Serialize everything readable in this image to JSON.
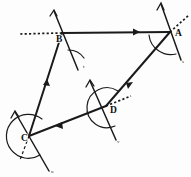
{
  "figure": {
    "kind": "geometry-diagram",
    "canvas": {
      "width": 191,
      "height": 177
    },
    "background_color": "#fdfdfd",
    "ink_color": "#1a1a1a",
    "vertices": [
      {
        "id": "A",
        "label": "A",
        "x": 170,
        "y": 32,
        "label_x": 175,
        "label_y": 36,
        "angle_arc": "minor"
      },
      {
        "id": "B",
        "label": "B",
        "x": 62,
        "y": 33,
        "label_x": 56,
        "label_y": 42,
        "angle_arc": "minor"
      },
      {
        "id": "C",
        "label": "C",
        "x": 29,
        "y": 136,
        "label_x": 22,
        "label_y": 141,
        "angle_arc": "reflex"
      },
      {
        "id": "D",
        "label": "D",
        "x": 106,
        "y": 106,
        "label_x": 110,
        "label_y": 113,
        "angle_arc": "reflex"
      }
    ],
    "edges": [
      {
        "id": "BA",
        "from": "B",
        "to": "A",
        "style": "solid",
        "arrow": "mid-forward"
      },
      {
        "id": "AD",
        "from": "A",
        "to": "D",
        "style": "solid",
        "arrow": "mid-forward"
      },
      {
        "id": "DC",
        "from": "D",
        "to": "C",
        "style": "solid",
        "arrow": "mid-forward"
      },
      {
        "id": "CB",
        "from": "C",
        "to": "B",
        "style": "solid",
        "arrow": "mid-forward"
      }
    ],
    "transversals": [
      {
        "id": "through-A",
        "vertex": "A",
        "note": "line crossing A running upper-left to lower-right"
      },
      {
        "id": "through-B",
        "vertex": "B",
        "note": "line crossing B running upper-right to lower-left"
      },
      {
        "id": "through-C",
        "vertex": "C",
        "note": "line crossing C running upper-left to lower-right"
      },
      {
        "id": "through-D",
        "vertex": "D",
        "note": "line crossing D running upper-left to lower-right"
      }
    ],
    "extension_rays": [
      {
        "id": "ray-A",
        "vertex": "A",
        "style": "dotted",
        "direction": "upper-right"
      },
      {
        "id": "ray-B",
        "vertex": "B",
        "style": "dotted",
        "direction": "left"
      },
      {
        "id": "ray-C",
        "vertex": "C",
        "style": "dashed",
        "direction": "lower-left"
      },
      {
        "id": "ray-D",
        "vertex": "D",
        "style": "dotted",
        "direction": "upper-right"
      }
    ],
    "tick_labels": [
      {
        "id": "tick-B",
        "text": "t",
        "x": 86,
        "y": 66
      },
      {
        "id": "tick-C",
        "text": "u",
        "x": 53,
        "y": 171
      },
      {
        "id": "tick-D",
        "text": "v",
        "x": 118,
        "y": 141
      },
      {
        "id": "tick-A",
        "text": "s",
        "x": 181,
        "y": 62
      }
    ]
  }
}
